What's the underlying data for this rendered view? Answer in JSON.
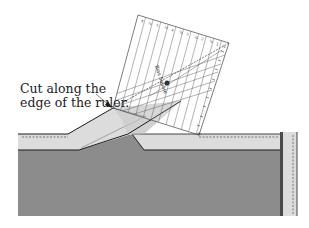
{
  "annotation": {
    "line1": "Cut along the",
    "line2": "edge of the ruler."
  },
  "ruler": {
    "brand_text": "Bias Square",
    "top_numbers": [
      "6",
      "½",
      "5",
      "½",
      "4",
      "½",
      "3",
      "½",
      "2",
      "½",
      "1",
      "½"
    ]
  },
  "colors": {
    "background": "#ffffff",
    "fabric_dark": "#8c8c8c",
    "fabric_light": "#dcdcdc",
    "outline": "#1a1a1a",
    "ruler_lines": "#555555"
  }
}
